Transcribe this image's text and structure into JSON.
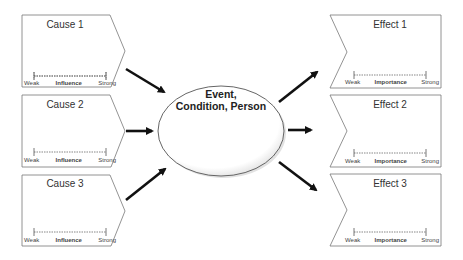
{
  "causes": [
    {
      "title": "Cause 1",
      "scale": {
        "low": "Weak",
        "label": "Influence",
        "high": "Strong"
      }
    },
    {
      "title": "Cause 2",
      "scale": {
        "low": "Weak",
        "label": "Influence",
        "high": "Strong"
      }
    },
    {
      "title": "Cause 3",
      "scale": {
        "low": "Weak",
        "label": "Influence",
        "high": "Strong"
      }
    }
  ],
  "center": {
    "line1": "Event,",
    "line2": "Condition, Person"
  },
  "effects": [
    {
      "title": "Effect 1",
      "scale": {
        "low": "Weak",
        "label": "Importance",
        "high": "Strong"
      }
    },
    {
      "title": "Effect 2",
      "scale": {
        "low": "Weak",
        "label": "Importance",
        "high": "Strong"
      }
    },
    {
      "title": "Effect 3",
      "scale": {
        "low": "Weak",
        "label": "Importance",
        "high": "Strong"
      }
    }
  ],
  "colors": {
    "stroke": "#666666",
    "arrow": "#111111",
    "background": "#ffffff"
  }
}
